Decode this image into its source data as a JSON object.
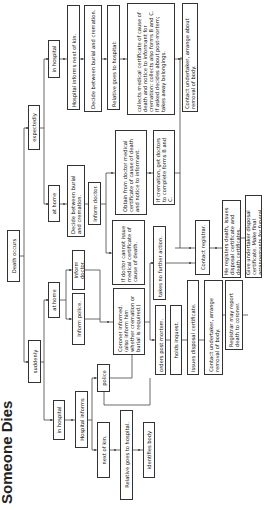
{
  "title": "Someone Dies",
  "orientation": "rotated 90 degrees counter-clockwise",
  "nodes": {
    "death_occurs": "Death occurs",
    "expectedly": "expectedly",
    "suddenly": "suddenly",
    "exp_in_hospital": "in hospital",
    "exp_at_home": "at home",
    "sud_at_home": "at home",
    "sud_in_hospital": "in hospital",
    "exp_hosp_informs": "Hospital informs next of kin.",
    "exp_hosp_decide": "Decide between burial and cremation.",
    "exp_hosp_relative": "Relative goes to hospital:",
    "exp_hosp_collects": "collects medical certificate of cause of death and notice to informant for cremation: collects also forms B and C. If asked decides about post-mortem; takes away belongings.",
    "exp_hosp_undertaker": "Contact undertaker, arrange about removal of body.",
    "exp_home_decide": "Decide between burial and cremation.",
    "exp_home_inform_doctor": "Inform doctor.",
    "exp_home_obtain": "Obtain from doctor medical certificate of cause of death and notice to informant.",
    "exp_home_cannot": "If doctor cannot issue medical certificate of cause of death.",
    "exp_home_cremation": "If cremation, get doctors to complete forms B and C.",
    "sud_home_police": "Inform police.",
    "sud_home_doctor": "Inform doctor.",
    "coroner": "Coroner informed. (also inform him whether cremation or burial is required.)",
    "no_further": "takes no further action.",
    "post_mortem": "orders post mortem.",
    "inquest": "holds inquest.",
    "disposal_cert": "Issues disposal certificate.",
    "sud_undertaker": "Contact undertaker, arrange removal of body.",
    "registrar": "Contact registrar.",
    "registers": "He registers death, issues disposal certificate and death certificates.",
    "registrar_report": "Registrar may report death to coroner.",
    "give_undertaker": "Give undertaker disposal certificate. Make final arrangements for funeral.",
    "sud_hosp_informs": "Hospital informs",
    "police": "police",
    "next_of_kin": "next of kin.",
    "sud_relative": "Relative goes to hospital.",
    "identifies": "identifies body"
  },
  "colors": {
    "line": "#444444",
    "border": "#333333",
    "text": "#111111",
    "background": "#ffffff"
  }
}
